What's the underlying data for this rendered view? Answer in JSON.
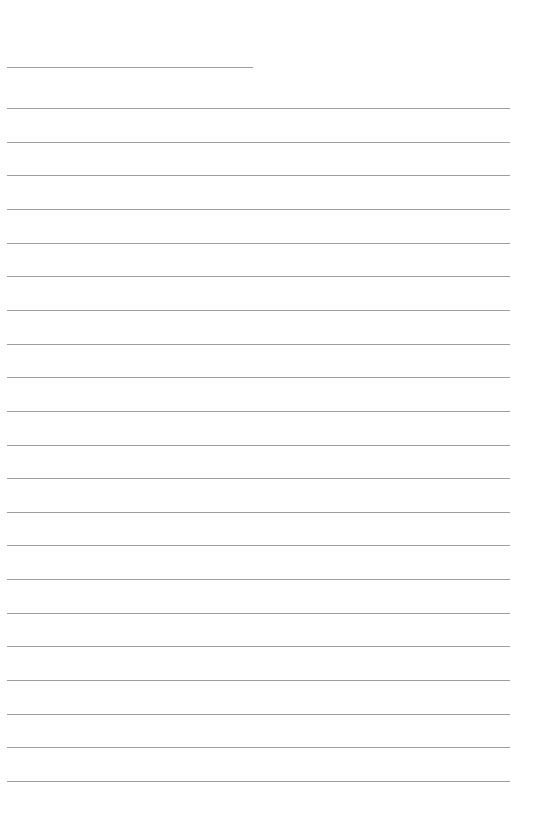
{
  "page": {
    "type": "lined-paper",
    "background_color": "#ffffff",
    "line_color": "#8c8c8c",
    "header_line": {
      "x_start": 7,
      "x_end": 253,
      "y": 67
    },
    "ruled_lines": {
      "count": 21,
      "x_start": 7,
      "x_end": 510,
      "first_y": 108,
      "spacing": 33.65
    }
  }
}
